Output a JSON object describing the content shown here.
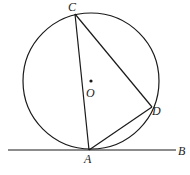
{
  "diagram": {
    "type": "geometry",
    "colors": {
      "stroke": "#1a1a1a",
      "background": "#ffffff"
    },
    "circle": {
      "center_label": "O",
      "cx": 91,
      "cy": 81,
      "r": 68
    },
    "points": {
      "A": {
        "label": "A",
        "x": 89,
        "y": 150
      },
      "B": {
        "label": "B",
        "x": 176,
        "y": 150
      },
      "C": {
        "label": "C",
        "x": 75,
        "y": 14
      },
      "D": {
        "label": "D",
        "x": 152,
        "y": 107
      },
      "O": {
        "label": "O",
        "x": 91,
        "y": 81
      }
    },
    "segments": [
      {
        "from": "C",
        "to": "A"
      },
      {
        "from": "C",
        "to": "D"
      },
      {
        "from": "A",
        "to": "D"
      }
    ],
    "tangent_line": {
      "label_end": "B",
      "x1": 8,
      "x2": 176,
      "y": 150
    }
  }
}
